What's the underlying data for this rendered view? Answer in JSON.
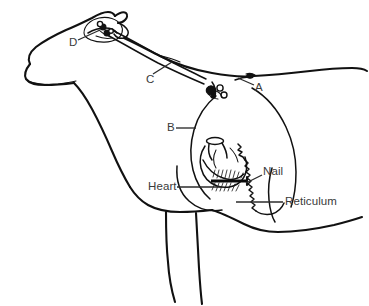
{
  "figure": {
    "kind": "veterinary-anatomy-line-drawing",
    "topic": "traumatic reticulopericarditis - nail penetrating reticulum",
    "background_color": "#ffffff",
    "line_color": "#111111",
    "label_color": "#3a3a3a"
  },
  "labels": {
    "a": "A",
    "b": "B",
    "c": "C",
    "d": "D",
    "heart": "Heart",
    "nail": "Nail",
    "reticulum": "Reticulum"
  },
  "label_positions": {
    "a": {
      "x": 255,
      "y": 82
    },
    "b": {
      "x": 167,
      "y": 123
    },
    "c": {
      "x": 146,
      "y": 74
    },
    "d": {
      "x": 69,
      "y": 37
    },
    "heart": {
      "x": 148,
      "y": 183
    },
    "nail": {
      "x": 263,
      "y": 168
    },
    "reticulum": {
      "x": 285,
      "y": 198
    }
  },
  "structures": [
    {
      "name": "head",
      "label_ref": "d",
      "note": "lymph node cluster at head"
    },
    {
      "name": "neck-vessel",
      "label_ref": "c",
      "note": "leader to long neck structure"
    },
    {
      "name": "withers-structure",
      "label_ref": "a",
      "note": "leader to dorsal lymph node"
    },
    {
      "name": "thorax-structure",
      "label_ref": "b",
      "note": "leader to thoracic outline"
    },
    {
      "name": "heart",
      "label_ref": "heart",
      "note": "heart with pericardium"
    },
    {
      "name": "nail",
      "label_ref": "nail",
      "note": "metal nail bar penetrating diaphragm"
    },
    {
      "name": "reticulum",
      "label_ref": "reticulum",
      "note": "reticulum wall with honeycomb texture"
    }
  ]
}
